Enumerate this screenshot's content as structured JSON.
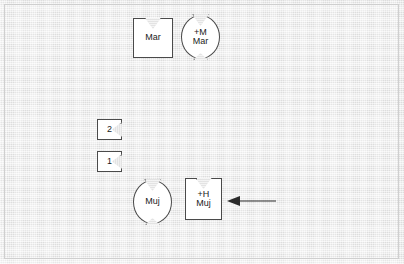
{
  "diagram": {
    "background_color": "#e6e6e6",
    "shape_fill": "#ffffff",
    "stroke_color": "#4a4a4a",
    "text_color": "#1b1b1b",
    "nodes": [
      {
        "id": "mar-square",
        "kind": "square-notch-top",
        "lines": [
          "Mar"
        ],
        "x": 133,
        "y": 18,
        "w": 40,
        "h": 40
      },
      {
        "id": "plus-m-mar-circle",
        "kind": "circle-notch-top-bottom",
        "lines": [
          "+M",
          "Mar"
        ],
        "x": 181,
        "y": 15,
        "w": 39,
        "h": 44
      },
      {
        "id": "tab-2",
        "kind": "tab-notch-right",
        "lines": [
          "2"
        ],
        "x": 97,
        "y": 119,
        "w": 25,
        "h": 21
      },
      {
        "id": "tab-1",
        "kind": "tab-notch-right",
        "lines": [
          "1"
        ],
        "x": 97,
        "y": 151,
        "w": 25,
        "h": 21
      },
      {
        "id": "muj-circle",
        "kind": "circle-notch-top-bottom",
        "lines": [
          "Muj"
        ],
        "x": 133,
        "y": 180,
        "w": 39,
        "h": 44
      },
      {
        "id": "plus-h-muj-square",
        "kind": "square-notch-top",
        "lines": [
          "+H",
          "Muj"
        ],
        "x": 185,
        "y": 178,
        "w": 37,
        "h": 42
      }
    ],
    "arrow": {
      "id": "pointer-arrow",
      "direction": "left",
      "x": 227,
      "y": 195,
      "length": 45,
      "color": "#2b2b2b"
    }
  }
}
